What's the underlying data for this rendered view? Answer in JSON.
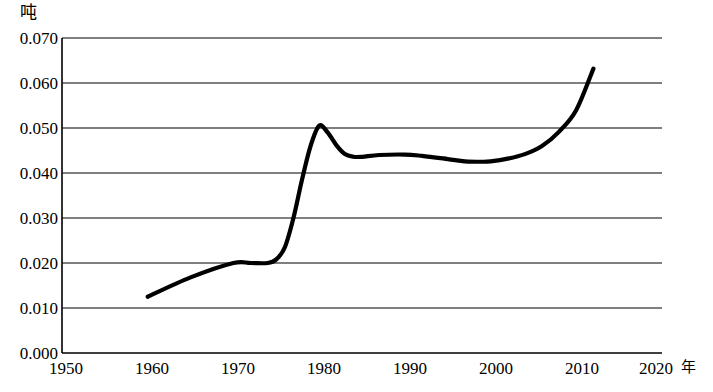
{
  "chart_data": {
    "type": "line",
    "title": "",
    "subtitle": "",
    "xlabel": "年",
    "ylabel": "吨",
    "ylim": [
      0.0,
      0.07
    ],
    "xlim": [
      1950,
      2020
    ],
    "grid": true,
    "legend": null,
    "y_ticks": [
      "0.070",
      "0.060",
      "0.050",
      "0.040",
      "0.030",
      "0.020",
      "0.010",
      "0.000"
    ],
    "y_tick_values": [
      0.07,
      0.06,
      0.05,
      0.04,
      0.03,
      0.02,
      0.01,
      0.0
    ],
    "x_ticks": [
      "1950",
      "1960",
      "1970",
      "1980",
      "1990",
      "2000",
      "2010",
      "2020"
    ],
    "x_tick_values": [
      1950,
      1960,
      1970,
      1980,
      1990,
      2000,
      2010,
      2020
    ],
    "series": [
      {
        "name": "人均用量",
        "color": "#000000",
        "x": [
          1960,
          1965,
          1970,
          1972,
          1974,
          1975,
          1976,
          1977,
          1978,
          1979,
          1980,
          1981,
          1982,
          1983,
          1984,
          1985,
          1987,
          1990,
          1992,
          1995,
          1997,
          1999,
          2000,
          2002,
          2004,
          2006,
          2008,
          2010,
          2012
        ],
        "values": [
          0.0125,
          0.0168,
          0.02,
          0.02,
          0.02,
          0.0208,
          0.0235,
          0.03,
          0.0385,
          0.046,
          0.0505,
          0.049,
          0.0462,
          0.0442,
          0.0436,
          0.0436,
          0.044,
          0.0441,
          0.0438,
          0.0431,
          0.0426,
          0.0425,
          0.0426,
          0.0432,
          0.0442,
          0.046,
          0.0492,
          0.054,
          0.0632
        ]
      }
    ],
    "annotations": []
  },
  "axis": {
    "y_unit": "吨",
    "x_unit": "年"
  }
}
